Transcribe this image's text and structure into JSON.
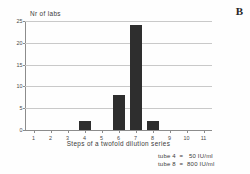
{
  "figure": {
    "panel_letter": "B"
  },
  "chart_data": {
    "type": "bar",
    "title": "",
    "subtitle": "",
    "xlabel": "Steps of a twofold dilution series",
    "ylabel": "Nr of labs",
    "categories": [
      "1",
      "2",
      "3",
      "4",
      "5",
      "6",
      "7",
      "8",
      "9",
      "10",
      "11"
    ],
    "values": [
      0,
      0,
      0,
      2,
      0,
      8,
      24,
      2,
      0,
      0,
      0
    ],
    "xlim": [
      0.5,
      11.5
    ],
    "ylim": [
      0,
      25
    ],
    "yticks": [
      "0",
      "5",
      "10",
      "15",
      "20",
      "25"
    ],
    "ytick_values": [
      0,
      5,
      10,
      15,
      20,
      25
    ],
    "grid": "horizontal",
    "legend": "none",
    "bar_color": "#2e2e2e",
    "grid_color": "#c9c9c9",
    "axis_color": "#8c8c8c",
    "annotations": [
      "tube 4  =   50 IU/ml",
      "tube 8  =  800 IU/ml"
    ]
  }
}
